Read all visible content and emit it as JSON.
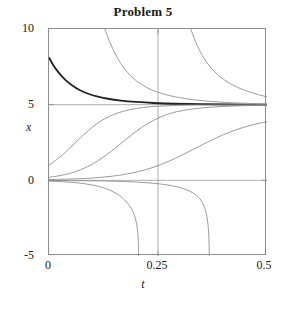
{
  "chart_data": {
    "type": "line",
    "title": "Problem 5",
    "xlabel": "t",
    "ylabel": "x",
    "xlim": [
      0,
      0.5
    ],
    "ylim": [
      -5,
      10
    ],
    "xticks": [
      0,
      0.25,
      0.5
    ],
    "xtick_labels": [
      "0",
      "0.25",
      "0.5"
    ],
    "yticks": [
      10,
      5,
      0,
      -5
    ],
    "ytick_labels": [
      "10",
      "5",
      "0",
      "-5"
    ],
    "grid": false,
    "gridlines": [
      {
        "axis": "y",
        "value": 5,
        "color": "#9a9a9a",
        "note": "equilibrium x=5"
      },
      {
        "axis": "y",
        "value": 0,
        "color": "#9a9a9a",
        "note": "equilibrium x=0"
      },
      {
        "axis": "x",
        "value": 0.25,
        "color": "#9a9a9a",
        "note": "vertical rule at t=0.25"
      }
    ],
    "equilibria": [
      0,
      5
    ],
    "model": "x' = 4 x (5 - x)",
    "series": [
      {
        "name": "x0 = 8.1 (highlighted solution)",
        "emphasis": true,
        "color": "#222222",
        "width": 1.8,
        "x0": 0.0,
        "y0": 8.1,
        "points": [
          [
            0.0,
            8.1
          ],
          [
            0.01,
            7.61
          ],
          [
            0.02,
            7.2
          ],
          [
            0.03,
            6.86
          ],
          [
            0.04,
            6.57
          ],
          [
            0.055,
            6.23
          ],
          [
            0.07,
            5.97
          ],
          [
            0.09,
            5.72
          ],
          [
            0.11,
            5.54
          ],
          [
            0.135,
            5.39
          ],
          [
            0.165,
            5.27
          ],
          [
            0.2,
            5.18
          ],
          [
            0.24,
            5.11
          ],
          [
            0.29,
            5.06
          ],
          [
            0.35,
            5.03
          ],
          [
            0.42,
            5.01
          ],
          [
            0.5,
            5.0
          ]
        ]
      },
      {
        "name": "x0 = 14.9 (enters top, decays to 5)",
        "emphasis": false,
        "color": "#909090",
        "width": 0.9,
        "x0": 0.128,
        "y0": 10.0,
        "points": [
          [
            0.128,
            10.0
          ],
          [
            0.14,
            9.1
          ],
          [
            0.152,
            8.35
          ],
          [
            0.165,
            7.71
          ],
          [
            0.18,
            7.13
          ],
          [
            0.195,
            6.7
          ],
          [
            0.212,
            6.34
          ],
          [
            0.23,
            6.05
          ],
          [
            0.25,
            5.82
          ],
          [
            0.275,
            5.61
          ],
          [
            0.3,
            5.46
          ],
          [
            0.33,
            5.33
          ],
          [
            0.365,
            5.23
          ],
          [
            0.405,
            5.15
          ],
          [
            0.45,
            5.09
          ],
          [
            0.5,
            5.05
          ]
        ]
      },
      {
        "name": "x0 = 31 (enters top near t=0.325, decays to 5)",
        "emphasis": false,
        "color": "#909090",
        "width": 0.9,
        "x0": 0.325,
        "y0": 10.0,
        "points": [
          [
            0.325,
            10.0
          ],
          [
            0.335,
            9.25
          ],
          [
            0.346,
            8.55
          ],
          [
            0.358,
            7.95
          ],
          [
            0.372,
            7.42
          ],
          [
            0.387,
            6.98
          ],
          [
            0.403,
            6.62
          ],
          [
            0.42,
            6.33
          ],
          [
            0.44,
            6.05
          ],
          [
            0.46,
            5.84
          ],
          [
            0.48,
            5.66
          ],
          [
            0.5,
            5.52
          ]
        ]
      },
      {
        "name": "x0 = 1.0 (logistic rise to 5)",
        "emphasis": false,
        "color": "#8e8e8e",
        "width": 0.9,
        "x0": 0.0,
        "y0": 1.0,
        "points": [
          [
            0.0,
            1.0
          ],
          [
            0.02,
            1.42
          ],
          [
            0.04,
            1.92
          ],
          [
            0.06,
            2.47
          ],
          [
            0.08,
            3.02
          ],
          [
            0.1,
            3.52
          ],
          [
            0.12,
            3.94
          ],
          [
            0.145,
            4.31
          ],
          [
            0.17,
            4.56
          ],
          [
            0.2,
            4.75
          ],
          [
            0.235,
            4.87
          ],
          [
            0.275,
            4.93
          ],
          [
            0.32,
            4.97
          ],
          [
            0.375,
            4.98
          ],
          [
            0.435,
            4.99
          ],
          [
            0.5,
            5.0
          ]
        ]
      },
      {
        "name": "x0 = 0.2 (logistic rise to 5)",
        "emphasis": false,
        "color": "#8e8e8e",
        "width": 0.9,
        "x0": 0.0,
        "y0": 0.2,
        "points": [
          [
            0.0,
            0.2
          ],
          [
            0.025,
            0.31
          ],
          [
            0.05,
            0.48
          ],
          [
            0.075,
            0.73
          ],
          [
            0.1,
            1.08
          ],
          [
            0.125,
            1.54
          ],
          [
            0.15,
            2.08
          ],
          [
            0.175,
            2.67
          ],
          [
            0.2,
            3.24
          ],
          [
            0.225,
            3.72
          ],
          [
            0.25,
            4.11
          ],
          [
            0.28,
            4.44
          ],
          [
            0.31,
            4.63
          ],
          [
            0.345,
            4.77
          ],
          [
            0.385,
            4.86
          ],
          [
            0.43,
            4.92
          ],
          [
            0.465,
            4.95
          ],
          [
            0.5,
            4.97
          ]
        ]
      },
      {
        "name": "x0 = 0.05 (slow logistic rise)",
        "emphasis": false,
        "color": "#8e8e8e",
        "width": 0.9,
        "x0": 0.0,
        "y0": 0.05,
        "points": [
          [
            0.0,
            0.05
          ],
          [
            0.04,
            0.08
          ],
          [
            0.08,
            0.12
          ],
          [
            0.12,
            0.2
          ],
          [
            0.16,
            0.33
          ],
          [
            0.2,
            0.54
          ],
          [
            0.235,
            0.82
          ],
          [
            0.265,
            1.14
          ],
          [
            0.295,
            1.53
          ],
          [
            0.325,
            1.96
          ],
          [
            0.355,
            2.4
          ],
          [
            0.385,
            2.82
          ],
          [
            0.415,
            3.19
          ],
          [
            0.445,
            3.49
          ],
          [
            0.472,
            3.7
          ],
          [
            0.5,
            3.88
          ]
        ]
      },
      {
        "name": "x0 = -0.05 (diverges, exits bottom at t = 0.204)",
        "emphasis": false,
        "color": "#8e8e8e",
        "width": 0.9,
        "x0": 0.0,
        "y0": -0.05,
        "points": [
          [
            0.0,
            -0.05
          ],
          [
            0.03,
            -0.09
          ],
          [
            0.06,
            -0.15
          ],
          [
            0.085,
            -0.24
          ],
          [
            0.105,
            -0.34
          ],
          [
            0.125,
            -0.49
          ],
          [
            0.142,
            -0.68
          ],
          [
            0.156,
            -0.9
          ],
          [
            0.168,
            -1.15
          ],
          [
            0.178,
            -1.44
          ],
          [
            0.186,
            -1.74
          ],
          [
            0.192,
            -2.04
          ],
          [
            0.196,
            -2.32
          ],
          [
            0.199,
            -2.62
          ],
          [
            0.2015,
            -2.95
          ],
          [
            0.2032,
            -3.32
          ],
          [
            0.2043,
            -3.72
          ],
          [
            0.205,
            -4.2
          ],
          [
            0.2055,
            -4.7
          ],
          [
            0.2058,
            -5.0
          ]
        ]
      },
      {
        "name": "x0 = -0.005 (diverges, exits bottom at t = 0.352)",
        "emphasis": false,
        "color": "#8e8e8e",
        "width": 0.9,
        "x0": 0.0,
        "y0": -0.005,
        "points": [
          [
            0.0,
            -0.01
          ],
          [
            0.05,
            -0.02
          ],
          [
            0.1,
            -0.03
          ],
          [
            0.15,
            -0.06
          ],
          [
            0.19,
            -0.1
          ],
          [
            0.225,
            -0.16
          ],
          [
            0.255,
            -0.24
          ],
          [
            0.28,
            -0.35
          ],
          [
            0.3,
            -0.48
          ],
          [
            0.316,
            -0.63
          ],
          [
            0.328,
            -0.8
          ],
          [
            0.338,
            -0.99
          ],
          [
            0.346,
            -1.22
          ],
          [
            0.352,
            -1.48
          ],
          [
            0.3565,
            -1.77
          ],
          [
            0.3598,
            -2.08
          ],
          [
            0.3622,
            -2.4
          ],
          [
            0.364,
            -2.75
          ],
          [
            0.3653,
            -3.12
          ],
          [
            0.3663,
            -3.55
          ],
          [
            0.367,
            -4.05
          ],
          [
            0.3675,
            -4.6
          ],
          [
            0.3678,
            -5.0
          ]
        ]
      }
    ]
  }
}
